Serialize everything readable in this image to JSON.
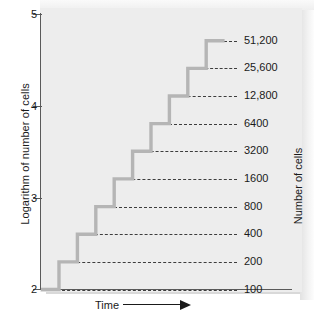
{
  "chart_data": {
    "type": "line",
    "subtype": "step",
    "title": "",
    "xlabel": "Time",
    "ylabel": "Logarithm of number of cells",
    "y2label": "Number of cells",
    "ylim": [
      2,
      5
    ],
    "yticks": [
      2,
      3,
      4,
      5
    ],
    "ytick_labels": [
      "2",
      "3",
      "4",
      "5"
    ],
    "grid": false,
    "legend": null,
    "x_axis_arrow": true,
    "x_tick_labels": [],
    "series": [
      {
        "name": "Cell count (binary fission)",
        "step_style": "post",
        "color": "#b5b5b5",
        "points": [
          {
            "cells": 100,
            "log_cells": 2.0,
            "label": "100"
          },
          {
            "cells": 200,
            "log_cells": 2.301,
            "label": "200"
          },
          {
            "cells": 400,
            "log_cells": 2.602,
            "label": "400"
          },
          {
            "cells": 800,
            "log_cells": 2.903,
            "label": "800"
          },
          {
            "cells": 1600,
            "log_cells": 3.204,
            "label": "1600"
          },
          {
            "cells": 3200,
            "log_cells": 3.505,
            "label": "3200"
          },
          {
            "cells": 6400,
            "log_cells": 3.806,
            "label": "6400"
          },
          {
            "cells": 12800,
            "log_cells": 4.107,
            "label": "12,800"
          },
          {
            "cells": 25600,
            "log_cells": 4.408,
            "label": "25,600"
          },
          {
            "cells": 51200,
            "log_cells": 4.709,
            "label": "51,200"
          }
        ]
      }
    ],
    "reference_lines": {
      "style": "dashed",
      "color": "#3d3d3d",
      "values": [
        100,
        200,
        400,
        800,
        1600,
        3200,
        6400,
        12800,
        25600,
        51200
      ]
    }
  },
  "colors": {
    "panel_background": "#ededed",
    "axis": "#5a5a5a",
    "step_line": "#b5b5b5",
    "dashed_line": "#3d3d3d",
    "text": "#1a1a1a"
  }
}
